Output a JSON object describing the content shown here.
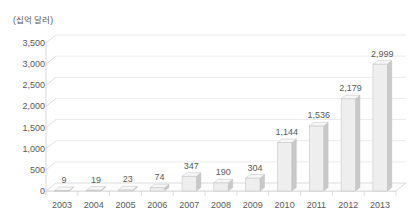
{
  "chart_data": {
    "type": "bar",
    "title": "",
    "subtitle": "",
    "xlabel": "",
    "ylabel": "(십억 달러)",
    "categories": [
      "2003",
      "2004",
      "2005",
      "2006",
      "2007",
      "2008",
      "2009",
      "2010",
      "2011",
      "2012",
      "2013"
    ],
    "values": [
      9,
      19,
      23,
      74,
      347,
      190,
      304,
      1144,
      1536,
      2179,
      2999
    ],
    "value_labels": [
      "9",
      "19",
      "23",
      "74",
      "347",
      "190",
      "304",
      "1,144",
      "1,536",
      "2,179",
      "2,999"
    ],
    "ylim": [
      0,
      3500
    ],
    "ytick_values": [
      0,
      500,
      1000,
      1500,
      2000,
      2500,
      3000,
      3500
    ],
    "ytick_labels": [
      "0",
      "500",
      "1,000",
      "1,500",
      "2,000",
      "2,500",
      "3,000",
      "3,500"
    ],
    "grid": true,
    "legend": "none",
    "style": "3d-column",
    "colors": {
      "bar_front": "#eeeeee",
      "bar_side": "#c9c9c9",
      "bar_top": "#f7f7f7",
      "bar_outline": "#bfbfbf",
      "gridline": "#e6e6e6",
      "axis": "#d0d0d0",
      "floor": "#fcfcfc",
      "text": "#595959",
      "background": "#ffffff"
    }
  }
}
